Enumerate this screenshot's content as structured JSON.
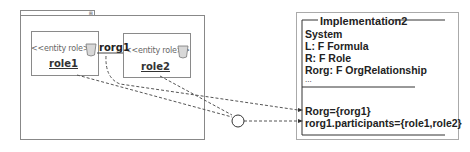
{
  "package": {
    "tab_icon": "⊞"
  },
  "roles": [
    {
      "stereotype": "<<entity role>>",
      "name": "role1",
      "icon": "role-cup-icon"
    },
    {
      "stereotype": "<<entity role>>",
      "name": "role2",
      "icon": "role-cup-icon"
    }
  ],
  "relationship": {
    "label": "rorg1"
  },
  "implementation": {
    "title": "Implementation2",
    "declarations": [
      "System",
      "L: F Formula",
      "R: F Role",
      "Rorg: F OrgRelationship",
      "..."
    ],
    "predicates": [
      "Rorg={rorg1}",
      "rorg1.participants={role1,role2}"
    ]
  },
  "colors": {
    "border": "#888888",
    "line": "#555555",
    "icon_fill": "#d8d8d8"
  }
}
